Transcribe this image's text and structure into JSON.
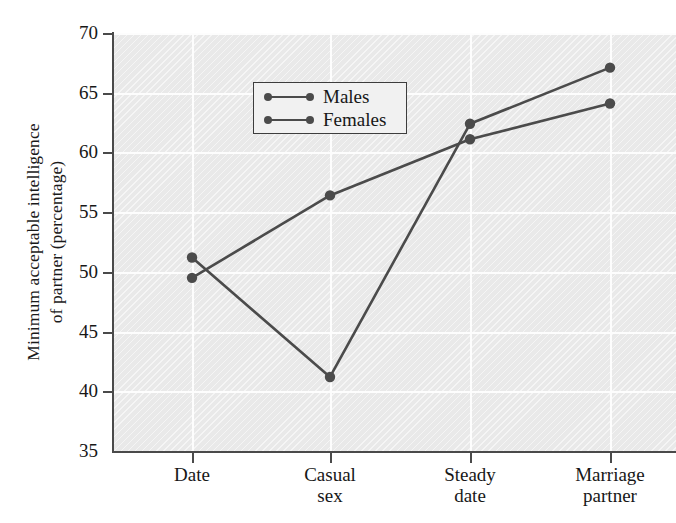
{
  "chart_data": {
    "type": "line",
    "title": "",
    "xlabel": "",
    "ylabel_line1": "Minimum acceptable intelligence",
    "ylabel_line2": "of partner (percentage)",
    "categories": [
      "Date",
      "Casual sex",
      "Steady date",
      "Marriage partner"
    ],
    "category_labels": [
      [
        "Date"
      ],
      [
        "Casual",
        "sex"
      ],
      [
        "Steady",
        "date"
      ],
      [
        "Marriage",
        "partner"
      ]
    ],
    "series": [
      {
        "name": "Males",
        "values": [
          51.2,
          41.2,
          62.4,
          67.1
        ]
      },
      {
        "name": "Females",
        "values": [
          49.5,
          56.4,
          61.1,
          64.1
        ]
      }
    ],
    "ylim": [
      35,
      70
    ],
    "yticks": [
      35,
      40,
      45,
      50,
      55,
      60,
      65,
      70
    ],
    "ytick_labels": [
      "35",
      "40",
      "45",
      "50",
      "55",
      "60",
      "65",
      "70"
    ],
    "grid": true,
    "legend_position": "upper left",
    "colors": {
      "series_line": "#4b4b4b",
      "plot_background": "#e9e9e9",
      "gridline": "#fdfdfd",
      "axis": "#4a4a4a",
      "text": "#171717"
    }
  }
}
